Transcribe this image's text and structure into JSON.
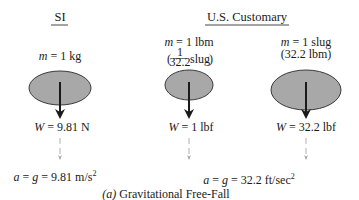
{
  "headers": {
    "si": "SI",
    "us": "U.S. Customary"
  },
  "cases": [
    {
      "id": "si-kg",
      "mass_symbol": "m",
      "mass_value": " = 1 kg",
      "mass_alt": "",
      "weight_symbol": "W",
      "weight_value": " = 9.81 N"
    },
    {
      "id": "us-lbm",
      "mass_symbol": "m",
      "mass_value": " = 1 lbm",
      "mass_alt_num": "1",
      "mass_alt_den": "32.2",
      "mass_alt_unit": "slug",
      "weight_symbol": "W",
      "weight_value": " = 1 lbf"
    },
    {
      "id": "us-slug",
      "mass_symbol": "m",
      "mass_value": " = 1 slug",
      "mass_alt": "(32.2 lbm)",
      "weight_symbol": "W",
      "weight_value": " = 32.2 lbf"
    }
  ],
  "accelerations": {
    "si": {
      "lhs": "a = g",
      "value": " = 9.81 m/s",
      "exp": "2"
    },
    "us": {
      "lhs": "a = g",
      "value": " = 32.2 ft/sec",
      "exp": "2"
    }
  },
  "caption": {
    "label": "(a)",
    "text": " Gravitational Free-Fall"
  },
  "colors": {
    "ellipse_fill": "#a8a8a8",
    "ellipse_stroke": "#3a3a3a",
    "weight_arrow": "#1a1a1a",
    "accel_arrow": "#b0b0b0",
    "text": "#1a1a1a"
  }
}
